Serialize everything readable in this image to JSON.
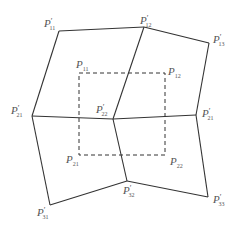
{
  "diagram": {
    "deformed_grid_labels": {
      "p11": {
        "base": "P",
        "prime": "′",
        "sub": "11"
      },
      "p12": {
        "base": "P",
        "prime": "′",
        "sub": "12"
      },
      "p13": {
        "base": "P",
        "prime": "′",
        "sub": "13"
      },
      "p21": {
        "base": "P",
        "prime": "′",
        "sub": "21"
      },
      "p22": {
        "base": "P",
        "prime": "′",
        "sub": "22"
      },
      "p23": {
        "base": "P",
        "prime": "′",
        "sub": "21"
      },
      "p31": {
        "base": "P",
        "prime": "′",
        "sub": "31"
      },
      "p32": {
        "base": "P",
        "prime": "′",
        "sub": "32"
      },
      "p33": {
        "base": "P",
        "prime": "′",
        "sub": "33"
      }
    },
    "original_square_labels": {
      "q11": {
        "base": "P",
        "sub": "11"
      },
      "q12": {
        "base": "P",
        "sub": "12"
      },
      "q21": {
        "base": "P",
        "sub": "21"
      },
      "q22": {
        "base": "P",
        "sub": "22"
      }
    }
  }
}
